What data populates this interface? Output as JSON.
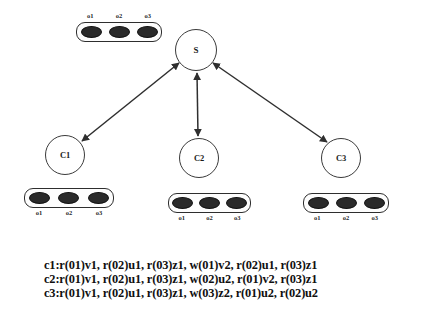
{
  "diagram": {
    "nodes": [
      {
        "id": "s",
        "label": "S",
        "cx": 196,
        "cy": 50,
        "r": 21
      },
      {
        "id": "c1",
        "label": "C1",
        "cx": 65,
        "cy": 155,
        "r": 20
      },
      {
        "id": "c2",
        "label": "C2",
        "cx": 199,
        "cy": 158,
        "r": 20
      },
      {
        "id": "c3",
        "label": "C3",
        "cx": 341,
        "cy": 158,
        "r": 20
      }
    ],
    "edges": [
      {
        "id": "edge-s-c1",
        "from": "s",
        "to": "c1",
        "style": "bidirectional"
      },
      {
        "id": "edge-s-c2",
        "from": "s",
        "to": "c2",
        "style": "bidirectional"
      },
      {
        "id": "edge-s-c3",
        "from": "s",
        "to": "c3",
        "style": "bidirectional"
      }
    ],
    "stores": [
      {
        "id": "store-server",
        "owner": "S",
        "labels_position": "above",
        "objects": [
          "o1",
          "o2",
          "o3"
        ],
        "x": 76,
        "y": 22,
        "width": 86,
        "height": 20
      },
      {
        "id": "store-c1",
        "owner": "C1",
        "labels_position": "below",
        "objects": [
          "o1",
          "o2",
          "o3"
        ],
        "x": 24,
        "y": 188,
        "width": 90,
        "height": 20
      },
      {
        "id": "store-c2",
        "owner": "C2",
        "labels_position": "below",
        "objects": [
          "o1",
          "o2",
          "o3"
        ],
        "x": 168,
        "y": 193,
        "width": 83,
        "height": 20
      },
      {
        "id": "store-c3",
        "owner": "C3",
        "labels_position": "below",
        "objects": [
          "o1",
          "o2",
          "o3"
        ],
        "x": 303,
        "y": 193,
        "width": 86,
        "height": 20
      }
    ],
    "colors": {
      "stroke": "#3a3a3a",
      "object_fill": "#2a2a2a",
      "text": "#101010",
      "background": "#ffffff"
    }
  },
  "log": {
    "lines": [
      "c1:r(01)v1, r(02)u1, r(03)z1, w(01)v2, r(02)u1, r(03)z1",
      "c2:r(01)v1, r(02)u1, r(03)z1, w(02)u2, r(01)v2, r(03)z1",
      "c3:r(01)v1, r(02)u1, r(03)z1, w(03)z2, r(01)u2, r(02)u2"
    ]
  }
}
